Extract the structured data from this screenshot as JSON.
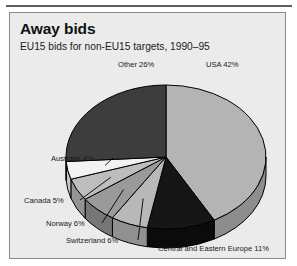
{
  "panel": {
    "title": "Away bids",
    "subtitle": "EU15 bids for non-EU15 targets, 1990–95"
  },
  "chart_data": {
    "type": "pie",
    "title": "Away bids",
    "subtitle": "EU15 bids for non-EU15 targets, 1990–95",
    "units": "percent",
    "start_angle_deg": 0,
    "direction": "clockwise",
    "three_d": true,
    "legend": "none",
    "labels_position": "outside-with-leader-lines",
    "categories": [
      "USA",
      "Central and Eastern Europe",
      "Switzerland",
      "Norway",
      "Canada",
      "Australia",
      "Other"
    ],
    "values": [
      42,
      11,
      6,
      6,
      5,
      4,
      26
    ],
    "total": 100,
    "slices": [
      {
        "name": "USA",
        "value": 42,
        "label": "USA 42%",
        "color": "#b4b4b4",
        "side_color": "#8d8d8d",
        "label_x": 196,
        "label_y": 10,
        "label_anchor": "start"
      },
      {
        "name": "Central and Eastern Europe",
        "value": 11,
        "label": "Central and Eastern Europe 11%",
        "color": "#161616",
        "side_color": "#0b0b0b",
        "label_x": 148,
        "label_y": 194,
        "label_anchor": "start"
      },
      {
        "name": "Switzerland",
        "value": 6,
        "label": "Switzerland 6%",
        "color": "#b8b8b8",
        "side_color": "#909090",
        "label_x": 56,
        "label_y": 186,
        "label_anchor": "start"
      },
      {
        "name": "Norway",
        "value": 6,
        "label": "Norway 6%",
        "color": "#9a9a9a",
        "side_color": "#767676",
        "label_x": 36,
        "label_y": 169,
        "label_anchor": "start"
      },
      {
        "name": "Canada",
        "value": 5,
        "label": "Canada 5%",
        "color": "#bdbdbd",
        "side_color": "#949494",
        "label_x": 14,
        "label_y": 146,
        "label_anchor": "start"
      },
      {
        "name": "Australia",
        "value": 4,
        "label": "Australia 4%",
        "color": "#f2f2f2",
        "side_color": "#c6c6c6",
        "label_x": 41,
        "label_y": 104,
        "label_anchor": "start"
      },
      {
        "name": "Other",
        "value": 26,
        "label": "Other 26%",
        "color": "#3d3d3d",
        "side_color": "#2c2c2c",
        "label_x": 108,
        "label_y": 10,
        "label_anchor": "start"
      }
    ],
    "geometry": {
      "cx": 156,
      "cy": 100,
      "rx": 100,
      "ry": 72,
      "depth": 19
    },
    "colors": {
      "outline": "#000000",
      "background": "#ebebeb",
      "text": "#1a1a1a"
    }
  }
}
